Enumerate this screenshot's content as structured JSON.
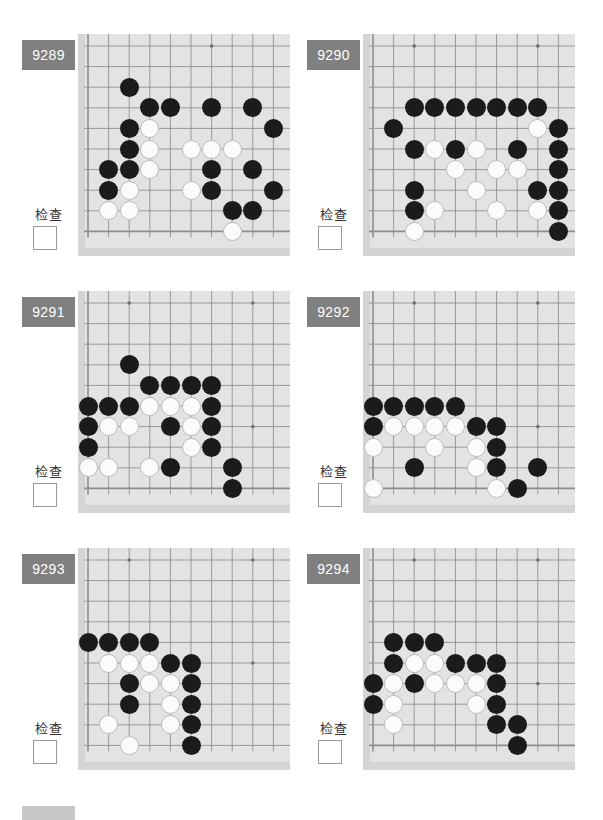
{
  "page": {
    "background_color": "#ffffff",
    "board_background_color": "#d4d4d4",
    "board_paper_color": "#e3e3e1",
    "badge_color": "#808080",
    "black_stone_color": "#1b1b1b",
    "white_stone_color": "#fbfbfb",
    "check_label": "检查",
    "board_columns": 10,
    "board_rows": 10
  },
  "problems": [
    {
      "id": "9289",
      "label": "9289",
      "check_label": "检查",
      "checked": false,
      "board": {
        "cols": 10,
        "rows": 10,
        "star_points": [
          [
            7,
            1
          ]
        ],
        "edges": {
          "left": true,
          "bottom": true,
          "top": false,
          "right": false
        },
        "black": [
          [
            3,
            3
          ],
          [
            4,
            4
          ],
          [
            5,
            4
          ],
          [
            7,
            4
          ],
          [
            9,
            4
          ],
          [
            3,
            5
          ],
          [
            10,
            5
          ],
          [
            3,
            6
          ],
          [
            2,
            7
          ],
          [
            3,
            7
          ],
          [
            7,
            7
          ],
          [
            9,
            7
          ],
          [
            2,
            8
          ],
          [
            7,
            8
          ],
          [
            10,
            8
          ],
          [
            8,
            9
          ],
          [
            9,
            9
          ]
        ],
        "white": [
          [
            4,
            5
          ],
          [
            4,
            6
          ],
          [
            6,
            6
          ],
          [
            7,
            6
          ],
          [
            8,
            6
          ],
          [
            4,
            7
          ],
          [
            3,
            8
          ],
          [
            6,
            8
          ],
          [
            2,
            9
          ],
          [
            3,
            9
          ],
          [
            8,
            10
          ]
        ]
      }
    },
    {
      "id": "9290",
      "label": "9290",
      "check_label": "检查",
      "checked": false,
      "board": {
        "cols": 10,
        "rows": 10,
        "star_points": [
          [
            3,
            1
          ],
          [
            9,
            1
          ]
        ],
        "edges": {
          "left": true,
          "bottom": true,
          "top": false,
          "right": false
        },
        "black": [
          [
            3,
            4
          ],
          [
            4,
            4
          ],
          [
            5,
            4
          ],
          [
            6,
            4
          ],
          [
            7,
            4
          ],
          [
            8,
            4
          ],
          [
            9,
            4
          ],
          [
            2,
            5
          ],
          [
            10,
            5
          ],
          [
            3,
            6
          ],
          [
            5,
            6
          ],
          [
            8,
            6
          ],
          [
            10,
            6
          ],
          [
            10,
            7
          ],
          [
            3,
            8
          ],
          [
            9,
            8
          ],
          [
            10,
            8
          ],
          [
            3,
            9
          ],
          [
            10,
            9
          ],
          [
            10,
            10
          ]
        ],
        "white": [
          [
            9,
            5
          ],
          [
            4,
            6
          ],
          [
            6,
            6
          ],
          [
            5,
            7
          ],
          [
            7,
            7
          ],
          [
            8,
            7
          ],
          [
            6,
            8
          ],
          [
            4,
            9
          ],
          [
            7,
            9
          ],
          [
            9,
            9
          ],
          [
            3,
            10
          ]
        ]
      }
    },
    {
      "id": "9291",
      "label": "9291",
      "check_label": "检查",
      "checked": false,
      "board": {
        "cols": 10,
        "rows": 10,
        "star_points": [
          [
            3,
            1
          ],
          [
            9,
            1
          ],
          [
            9,
            7
          ]
        ],
        "edges": {
          "left": true,
          "bottom": true,
          "top": false,
          "right": false
        },
        "black": [
          [
            3,
            4
          ],
          [
            4,
            5
          ],
          [
            5,
            5
          ],
          [
            6,
            5
          ],
          [
            7,
            5
          ],
          [
            1,
            6
          ],
          [
            2,
            6
          ],
          [
            3,
            6
          ],
          [
            7,
            6
          ],
          [
            1,
            7
          ],
          [
            5,
            7
          ],
          [
            7,
            7
          ],
          [
            1,
            8
          ],
          [
            7,
            8
          ],
          [
            5,
            9
          ],
          [
            8,
            9
          ],
          [
            8,
            10
          ]
        ],
        "white": [
          [
            4,
            6
          ],
          [
            5,
            6
          ],
          [
            6,
            6
          ],
          [
            2,
            7
          ],
          [
            3,
            7
          ],
          [
            6,
            7
          ],
          [
            6,
            8
          ],
          [
            1,
            9
          ],
          [
            2,
            9
          ],
          [
            4,
            9
          ]
        ]
      }
    },
    {
      "id": "9292",
      "label": "9292",
      "check_label": "检查",
      "checked": false,
      "board": {
        "cols": 10,
        "rows": 10,
        "star_points": [
          [
            3,
            1
          ],
          [
            9,
            1
          ],
          [
            9,
            7
          ]
        ],
        "edges": {
          "left": true,
          "bottom": true,
          "top": false,
          "right": false
        },
        "black": [
          [
            1,
            6
          ],
          [
            2,
            6
          ],
          [
            3,
            6
          ],
          [
            4,
            6
          ],
          [
            5,
            6
          ],
          [
            1,
            7
          ],
          [
            6,
            7
          ],
          [
            7,
            7
          ],
          [
            7,
            8
          ],
          [
            3,
            9
          ],
          [
            7,
            9
          ],
          [
            9,
            9
          ],
          [
            8,
            10
          ]
        ],
        "white": [
          [
            2,
            7
          ],
          [
            3,
            7
          ],
          [
            4,
            7
          ],
          [
            5,
            7
          ],
          [
            1,
            8
          ],
          [
            4,
            8
          ],
          [
            6,
            8
          ],
          [
            6,
            9
          ],
          [
            1,
            10
          ],
          [
            7,
            10
          ]
        ]
      }
    },
    {
      "id": "9293",
      "label": "9293",
      "check_label": "检查",
      "checked": false,
      "board": {
        "cols": 10,
        "rows": 10,
        "star_points": [
          [
            3,
            1
          ],
          [
            9,
            1
          ],
          [
            9,
            6
          ]
        ],
        "edges": {
          "left": true,
          "bottom": false,
          "top": false,
          "right": false
        },
        "black": [
          [
            1,
            5
          ],
          [
            2,
            5
          ],
          [
            3,
            5
          ],
          [
            4,
            5
          ],
          [
            5,
            6
          ],
          [
            6,
            6
          ],
          [
            3,
            7
          ],
          [
            6,
            7
          ],
          [
            3,
            8
          ],
          [
            6,
            8
          ],
          [
            6,
            9
          ],
          [
            6,
            10
          ]
        ],
        "white": [
          [
            2,
            6
          ],
          [
            3,
            6
          ],
          [
            4,
            6
          ],
          [
            4,
            7
          ],
          [
            5,
            7
          ],
          [
            5,
            8
          ],
          [
            2,
            9
          ],
          [
            5,
            9
          ],
          [
            3,
            10
          ]
        ]
      }
    },
    {
      "id": "9294",
      "label": "9294",
      "check_label": "检查",
      "checked": false,
      "board": {
        "cols": 10,
        "rows": 10,
        "star_points": [
          [
            3,
            1
          ],
          [
            9,
            1
          ],
          [
            9,
            7
          ]
        ],
        "edges": {
          "left": true,
          "bottom": true,
          "top": false,
          "right": false
        },
        "black": [
          [
            2,
            5
          ],
          [
            3,
            5
          ],
          [
            4,
            5
          ],
          [
            2,
            6
          ],
          [
            5,
            6
          ],
          [
            6,
            6
          ],
          [
            7,
            6
          ],
          [
            1,
            7
          ],
          [
            3,
            7
          ],
          [
            7,
            7
          ],
          [
            1,
            8
          ],
          [
            7,
            8
          ],
          [
            7,
            9
          ],
          [
            8,
            9
          ],
          [
            8,
            10
          ]
        ],
        "white": [
          [
            3,
            6
          ],
          [
            4,
            6
          ],
          [
            2,
            7
          ],
          [
            4,
            7
          ],
          [
            5,
            7
          ],
          [
            6,
            7
          ],
          [
            2,
            8
          ],
          [
            6,
            8
          ],
          [
            2,
            9
          ]
        ]
      }
    }
  ]
}
